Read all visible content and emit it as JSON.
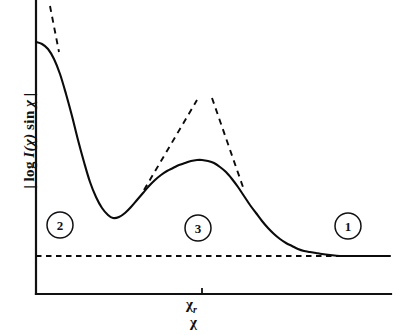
{
  "figure": {
    "background_color": "#ffffff",
    "ink_color": "#111111"
  },
  "axes": {
    "y_label": "| log I(χ) sin χ |",
    "y_label_parts": {
      "open_bar": "|",
      "log": "log",
      "intensity_symbol": "I",
      "argument": "(χ)",
      "sine": "sin",
      "variable": "χ",
      "close_bar": "|"
    },
    "x_label": "χ",
    "x_tick_label": "χ",
    "x_tick_subscript": "r",
    "x_tick_label_full": "χr",
    "x_tick_position_px": 202
  },
  "markers": [
    {
      "label": "2",
      "cx": 60,
      "cy": 225,
      "r": 13
    },
    {
      "label": "3",
      "cx": 198,
      "cy": 228,
      "r": 13
    },
    {
      "label": "1",
      "cx": 348,
      "cy": 226,
      "r": 13
    }
  ],
  "chart_data": {
    "type": "line",
    "title": "",
    "xlabel": "χ",
    "ylabel": "| log I(χ) sin χ |",
    "grid": false,
    "legend": "none",
    "axis_ticks": {
      "x": [
        "χr"
      ],
      "y": []
    },
    "xlim": [
      0,
      1
    ],
    "ylim": [
      0,
      1
    ],
    "annotations": [
      {
        "text": "2",
        "style": "circled",
        "x_px": 60,
        "y_px": 225,
        "region": "small-angle regime"
      },
      {
        "text": "3",
        "style": "circled",
        "x_px": 198,
        "y_px": 228,
        "region": "rainbow regime"
      },
      {
        "text": "1",
        "style": "circled",
        "x_px": 348,
        "y_px": 226,
        "region": "large-angle regime"
      }
    ],
    "series": [
      {
        "name": "solid-curve",
        "style": "solid",
        "description": "Deflection function magnitude: steep small-angle rise at left, minimum, rainbow maximum at chi_r, decay to constant background",
        "points_px": [
          [
            36,
            42
          ],
          [
            42,
            44
          ],
          [
            48,
            49
          ],
          [
            54,
            59
          ],
          [
            60,
            74
          ],
          [
            66,
            94
          ],
          [
            72,
            116
          ],
          [
            78,
            140
          ],
          [
            84,
            162
          ],
          [
            90,
            182
          ],
          [
            96,
            197
          ],
          [
            102,
            208
          ],
          [
            108,
            215
          ],
          [
            113,
            218
          ],
          [
            119,
            217
          ],
          [
            125,
            213
          ],
          [
            131,
            207
          ],
          [
            137,
            200
          ],
          [
            143,
            193
          ],
          [
            149,
            186
          ],
          [
            155,
            180
          ],
          [
            161,
            175
          ],
          [
            167,
            171
          ],
          [
            173,
            168
          ],
          [
            179,
            165
          ],
          [
            185,
            163
          ],
          [
            191,
            161
          ],
          [
            197,
            160
          ],
          [
            202,
            160
          ],
          [
            208,
            161
          ],
          [
            214,
            163
          ],
          [
            220,
            167
          ],
          [
            226,
            172
          ],
          [
            232,
            179
          ],
          [
            238,
            187
          ],
          [
            244,
            196
          ],
          [
            250,
            205
          ],
          [
            256,
            213
          ],
          [
            262,
            221
          ],
          [
            268,
            228
          ],
          [
            274,
            234
          ],
          [
            280,
            239
          ],
          [
            286,
            243
          ],
          [
            292,
            246
          ],
          [
            298,
            249
          ],
          [
            304,
            251
          ],
          [
            310,
            252
          ],
          [
            316,
            253
          ],
          [
            322,
            254
          ],
          [
            330,
            255
          ],
          [
            340,
            256
          ],
          [
            352,
            256
          ],
          [
            366,
            256
          ],
          [
            380,
            256
          ],
          [
            390,
            256
          ]
        ]
      },
      {
        "name": "asymptote-small-angle",
        "style": "dashed",
        "description": "Steep divergent asymptote at small chi (region 2 boundary)",
        "points_px": [
          [
            50,
            6
          ],
          [
            59,
            52
          ]
        ]
      },
      {
        "name": "asymptote-rainbow-left",
        "style": "dashed",
        "description": "Left branch of divergent rainbow-angle asymptote",
        "points_px": [
          [
            144,
            190
          ],
          [
            197,
            100
          ]
        ]
      },
      {
        "name": "asymptote-rainbow-right",
        "style": "dashed",
        "description": "Right branch of divergent rainbow-angle asymptote",
        "points_px": [
          [
            212,
            98
          ],
          [
            244,
            190
          ]
        ]
      },
      {
        "name": "asymptote-baseline",
        "style": "dashed-horizontal",
        "description": "Constant background level approached at large chi",
        "points_px": [
          [
            36,
            256
          ],
          [
            390,
            256
          ]
        ]
      }
    ]
  }
}
